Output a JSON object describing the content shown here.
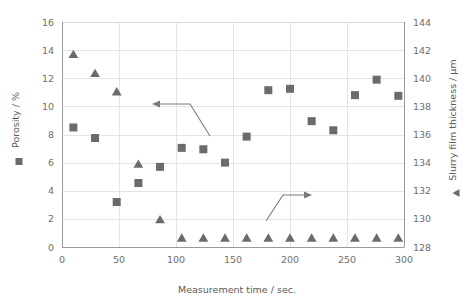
{
  "chart_data": {
    "type": "scatter",
    "title": "",
    "xlabel": "Measurement time / sec.",
    "ylabel": "Porosity / %",
    "y2label": "Slurry film thickness / µm",
    "xlim": [
      0,
      300
    ],
    "ylim": [
      0,
      16
    ],
    "y2lim": [
      128,
      144
    ],
    "xticks": [
      0,
      50,
      100,
      150,
      200,
      250,
      300
    ],
    "yticks": [
      0,
      2,
      4,
      6,
      8,
      10,
      12,
      14,
      16
    ],
    "y2ticks": [
      128,
      130,
      132,
      134,
      136,
      138,
      140,
      142,
      144
    ],
    "grid": true,
    "legend_position": "axis-titles",
    "series": [
      {
        "name": "Porosity / %",
        "axis": "left",
        "marker": "square",
        "color": "#6b6b6b",
        "points": [
          {
            "x": 10,
            "y": 8.5
          },
          {
            "x": 29,
            "y": 7.75
          },
          {
            "x": 48,
            "y": 3.2
          },
          {
            "x": 67,
            "y": 4.55
          },
          {
            "x": 86,
            "y": 5.7
          },
          {
            "x": 105,
            "y": 7.05
          },
          {
            "x": 124,
            "y": 6.95
          },
          {
            "x": 143,
            "y": 6.0
          },
          {
            "x": 162,
            "y": 7.85
          },
          {
            "x": 181,
            "y": 11.15
          },
          {
            "x": 200,
            "y": 11.25
          },
          {
            "x": 219,
            "y": 8.95
          },
          {
            "x": 238,
            "y": 8.3
          },
          {
            "x": 257,
            "y": 10.8
          },
          {
            "x": 276,
            "y": 11.9
          },
          {
            "x": 295,
            "y": 10.75
          }
        ]
      },
      {
        "name": "Slurry film thickness / µm",
        "axis": "right",
        "marker": "triangle",
        "color": "#6b6b6b",
        "points": [
          {
            "x": 10,
            "y": 141.7
          },
          {
            "x": 29,
            "y": 140.35
          },
          {
            "x": 48,
            "y": 139.05
          },
          {
            "x": 67,
            "y": 133.9
          },
          {
            "x": 86,
            "y": 129.95
          },
          {
            "x": 105,
            "y": 128.65
          },
          {
            "x": 124,
            "y": 128.65
          },
          {
            "x": 143,
            "y": 128.65
          },
          {
            "x": 162,
            "y": 128.65
          },
          {
            "x": 181,
            "y": 128.65
          },
          {
            "x": 200,
            "y": 128.65
          },
          {
            "x": 219,
            "y": 128.65
          },
          {
            "x": 238,
            "y": 128.65
          },
          {
            "x": 257,
            "y": 128.65
          },
          {
            "x": 276,
            "y": 128.65
          },
          {
            "x": 295,
            "y": 128.65
          }
        ]
      }
    ],
    "annotations": [
      {
        "name": "left-axis-pointer",
        "direction": "left",
        "description": "Elbow arrow pointing left toward the porosity axis"
      },
      {
        "name": "right-axis-pointer",
        "direction": "right",
        "description": "Elbow arrow pointing right toward the slurry film thickness axis"
      }
    ]
  },
  "axes": {
    "x": {
      "title": "Measurement time / sec.",
      "ticks": [
        "0",
        "50",
        "100",
        "150",
        "200",
        "250",
        "300"
      ]
    },
    "y_left": {
      "title": "Porosity / %",
      "ticks": [
        "16",
        "14",
        "12",
        "10",
        "8",
        "6",
        "4",
        "2",
        "0"
      ]
    },
    "y_right": {
      "title": "Slurry film thickness / µm",
      "ticks": [
        "144",
        "142",
        "140",
        "138",
        "136",
        "134",
        "132",
        "130",
        "128"
      ]
    }
  },
  "colors": {
    "marker": "#6b6b6b",
    "grid": "#e4e4e4",
    "axis": "#9a9a9a",
    "text": "#6e6e6e",
    "background": "#ffffff"
  }
}
